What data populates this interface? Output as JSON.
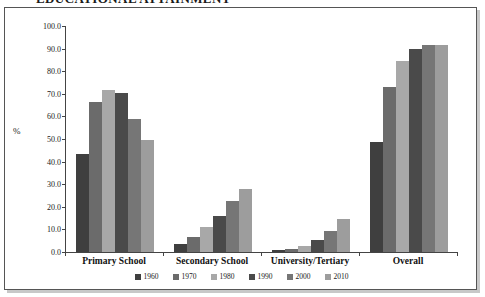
{
  "page": {
    "title_clipped": "EDUCATIONAL ATTAINMENT"
  },
  "chart_data": {
    "type": "bar",
    "title": "",
    "xlabel": "",
    "ylabel": "%",
    "ylim": [
      0,
      100
    ],
    "ytick_labels": [
      "100.0",
      "90.0",
      "80.0",
      "70.0",
      "60.0",
      "50.0",
      "40.0",
      "30.0",
      "20.0",
      "10.0",
      "0.0"
    ],
    "ytick_values": [
      100,
      90,
      80,
      70,
      60,
      50,
      40,
      30,
      20,
      10,
      0
    ],
    "grid": false,
    "legend_position": "bottom",
    "categories": [
      "Primary School",
      "Secondary School",
      "University/Tertiary",
      "Overall"
    ],
    "series": [
      {
        "name": "1960",
        "color": "#3f3f3f",
        "values": [
          43.5,
          3.5,
          0.8,
          48.5
        ]
      },
      {
        "name": "1970",
        "color": "#6b6b6b",
        "values": [
          66.5,
          6.5,
          1.2,
          73.0
        ]
      },
      {
        "name": "1980",
        "color": "#a8a8a8",
        "values": [
          71.5,
          11.0,
          2.6,
          84.5
        ]
      },
      {
        "name": "1990",
        "color": "#4a4a4a",
        "values": [
          70.5,
          16.0,
          5.2,
          90.0
        ]
      },
      {
        "name": "2000",
        "color": "#767676",
        "values": [
          59.0,
          22.5,
          9.5,
          91.5
        ]
      },
      {
        "name": "2010",
        "color": "#9d9d9d",
        "values": [
          49.5,
          28.0,
          14.5,
          91.5
        ]
      }
    ]
  },
  "colors": {
    "frame_border": "#555555",
    "frame_shadow": "#c8c8c8",
    "axis": "#444444",
    "background": "#ffffff"
  }
}
